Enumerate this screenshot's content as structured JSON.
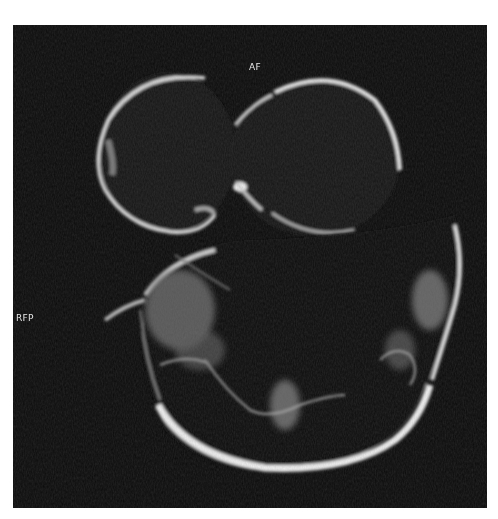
{
  "image": {
    "type": "MRI axial slice",
    "background_color": "#0b0b0b",
    "page_background": "#ffffff"
  },
  "orientation_labels": {
    "top": "AF",
    "left": "RFP"
  }
}
